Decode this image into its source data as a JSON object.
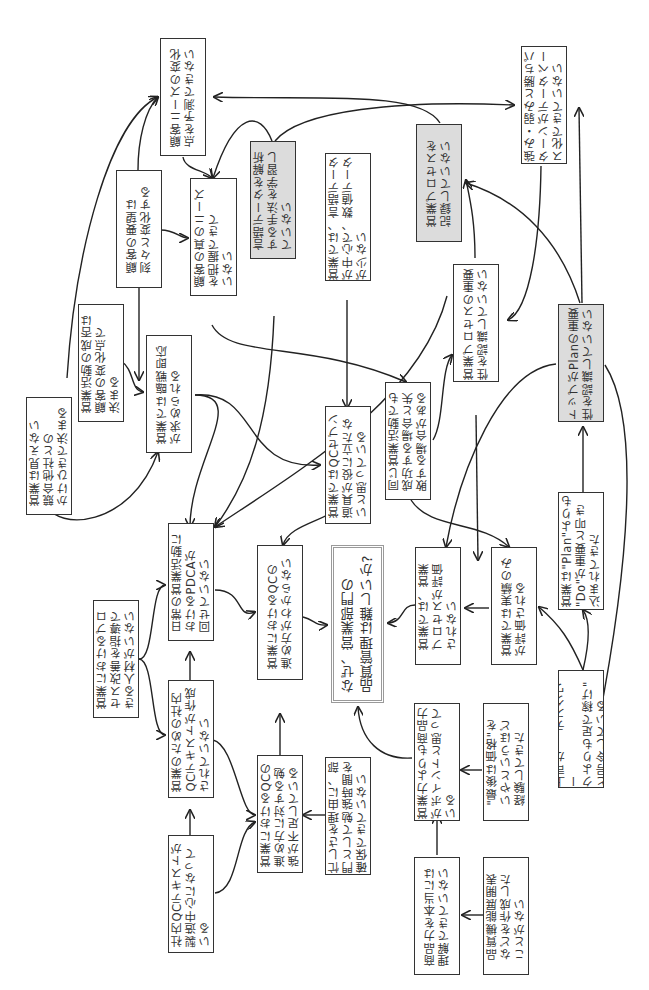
{
  "diagram": {
    "orientation": "rotated-90-ccw",
    "colors": {
      "border": "#333333",
      "shaded_fill": "#dcdcdc",
      "center_border": "#9a9a9a",
      "line": "#222222"
    },
    "nodes": [
      {
        "id": "n1",
        "text": "顧客ニーズの変化\n点を予測できない",
        "shaded": false
      },
      {
        "id": "n2",
        "text": "顧客の要望は\n刻々と変化する",
        "shaded": false
      },
      {
        "id": "n3",
        "text": "顧客の真のニーズ\nを把握できて\nいない",
        "shaded": false
      },
      {
        "id": "n4",
        "text": "言語データを解析\nする手法を学習し\nていない",
        "shaded": true
      },
      {
        "id": "n5",
        "text": "営業では、言語データ\nが中心で、数値データ\nが少ない",
        "shaded": false
      },
      {
        "id": "n6",
        "text": "営業プロセスを\n記録していない",
        "shaded": true
      },
      {
        "id": "n7",
        "text": "強み・弱みと勝ちパ\nターンがデータベー\nス化できていない",
        "shaded": false
      },
      {
        "id": "n8",
        "text": "営業活動の成否は\n顧客の変化点で\n決まる",
        "shaded": false
      },
      {
        "id": "n9",
        "text": "営業では臨戦即応\nが求められる",
        "shaded": false
      },
      {
        "id": "n10",
        "text": "営業は見えない\n競合他社との\nかけひきで決まる",
        "shaded": false
      },
      {
        "id": "n11",
        "text": "営業プロセスの重要\n性を認識していない",
        "shaded": false
      },
      {
        "id": "n12",
        "text": "トップがPlanの重要\n性を認識していない",
        "shaded": true
      },
      {
        "id": "n13",
        "text": "同じ営業活動でも\n成功する場合と失\n敗する場合がある",
        "shaded": false
      },
      {
        "id": "n14",
        "text": "営業ではQCセブン\n道具が役に立たな\nいと思っている",
        "shaded": false
      },
      {
        "id": "n15",
        "text": "日常の営業活動に\nおけるPDCAが\n回せていない",
        "shaded": false
      },
      {
        "id": "n16",
        "text": "営業におけるプロ\nセス改善を指導で\nきる人材がいない",
        "shaded": false
      },
      {
        "id": "n17",
        "text": "営業のための社内\nQCテキストが作成\nされていない",
        "shaded": false
      },
      {
        "id": "n18",
        "text": "営業におけるQCの\n進め方がわからない",
        "shaded": false
      },
      {
        "id": "center",
        "text": "なぜ、営業部門の\n品質管理は難しいか?",
        "shaded": false,
        "is_center": true
      },
      {
        "id": "n19",
        "text": "営業では、営業\nプロセスが評価\nされない",
        "shaded": false
      },
      {
        "id": "n20",
        "text": "営業では実績のみ\nが評価される",
        "shaded": false
      },
      {
        "id": "n21",
        "text": "営業は\"Plan\"よりも\n\"Do\"が重要と叩き\n込まれてきた",
        "shaded": false
      },
      {
        "id": "n22",
        "text": "社内QCテキストが\n製造中心になって\nいる",
        "shaded": false
      },
      {
        "id": "n23",
        "text": "営業におけるQCの\n進め方に対する勉\n強が不足している",
        "shaded": false
      },
      {
        "id": "n24",
        "text": "忙しさを理由に、部\n門として勉強時間を\n確保できていない",
        "shaded": false
      },
      {
        "id": "n25",
        "text": "営業力よりも商品力\nがポイントと思って\nいる",
        "shaded": false
      },
      {
        "id": "n26",
        "text": "\"最後は価格\"を\nいやというほど\n経験してきた",
        "shaded": false
      },
      {
        "id": "n27",
        "text": "上司が、\"デスクワー\nクよりも足で稼げ\"\nと号令している",
        "shaded": false
      },
      {
        "id": "n28",
        "text": "商品力を本当には\n理解できていない",
        "shaded": false
      },
      {
        "id": "n29",
        "text": "品質機能展開表\nなどを作成した\nことがない",
        "shaded": false
      }
    ]
  }
}
